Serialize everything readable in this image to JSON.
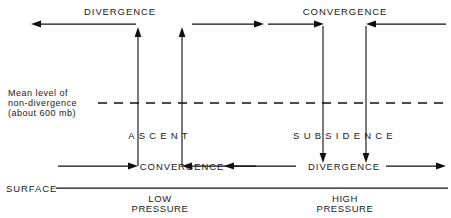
{
  "diagram": {
    "colors": {
      "ink": "#101010",
      "background": "#ffffff"
    },
    "labels": {
      "top_left": "DIVERGENCE",
      "top_right": "CONVERGENCE",
      "middle_left": "ASCENT",
      "middle_right": "SUBSIDENCE",
      "bottom_left": "CONVERGENCE",
      "bottom_right": "DIVERGENCE",
      "surface": "SURFACE",
      "mean_level_line1": "Mean level of",
      "mean_level_line2": "non-divergence",
      "mean_level_line3": "(about 600 mb)",
      "low_pressure_line1": "LOW",
      "low_pressure_line2": "PRESSURE",
      "high_pressure_line1": "HIGH",
      "high_pressure_line2": "PRESSURE"
    },
    "icons": {
      "arrow_left": "arrow-left-icon",
      "arrow_right": "arrow-right-icon",
      "arrow_up": "arrow-up-icon",
      "arrow_down": "arrow-down-icon",
      "dashed_level": "dashed-level-line-icon"
    }
  }
}
